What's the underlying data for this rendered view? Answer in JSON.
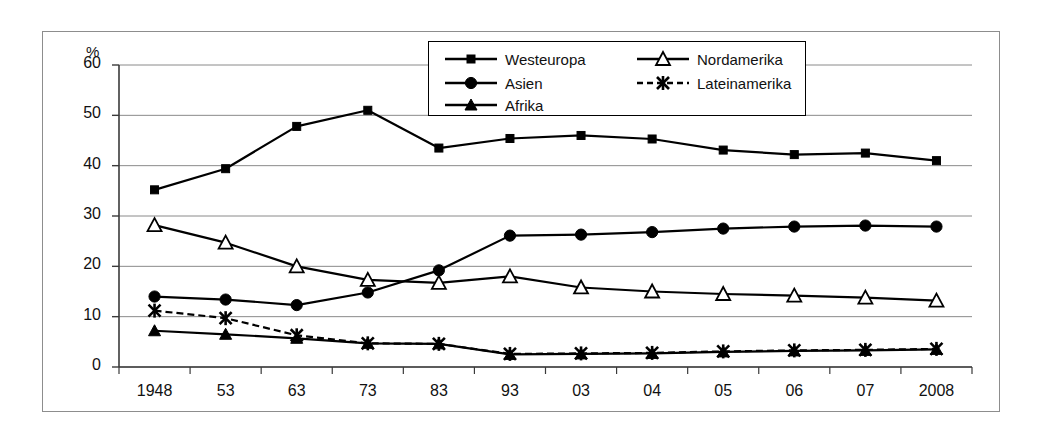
{
  "chart_data": {
    "type": "line",
    "title": "",
    "xlabel": "",
    "ylabel": "%",
    "ylim": [
      0,
      60
    ],
    "ytick_step": 10,
    "grid": true,
    "legend_position": "top-center",
    "categories": [
      "1948",
      "53",
      "63",
      "73",
      "83",
      "93",
      "03",
      "04",
      "05",
      "06",
      "07",
      "2008"
    ],
    "yticks": [
      "0",
      "10",
      "20",
      "30",
      "40",
      "50",
      "60"
    ],
    "series": [
      {
        "name": "Westeuropa",
        "marker": "filled-square",
        "line": "solid",
        "color": "#000000",
        "values": [
          35.2,
          39.4,
          47.8,
          51.0,
          43.5,
          45.4,
          46.0,
          45.3,
          43.1,
          42.2,
          42.5,
          41.0
        ]
      },
      {
        "name": "Asien",
        "marker": "filled-circle",
        "line": "solid",
        "color": "#000000",
        "values": [
          14.0,
          13.4,
          12.3,
          14.8,
          19.2,
          26.1,
          26.3,
          26.8,
          27.5,
          27.9,
          28.1,
          27.9
        ]
      },
      {
        "name": "Afrika",
        "marker": "filled-triangle",
        "line": "solid",
        "color": "#000000",
        "values": [
          7.2,
          6.5,
          5.7,
          4.7,
          4.6,
          2.5,
          2.6,
          2.7,
          3.0,
          3.2,
          3.3,
          3.5
        ]
      },
      {
        "name": "Nordamerika",
        "marker": "open-triangle",
        "line": "solid",
        "color": "#000000",
        "values": [
          28.2,
          24.7,
          20.0,
          17.3,
          16.7,
          18.0,
          15.8,
          15.0,
          14.5,
          14.2,
          13.8,
          13.2
        ]
      },
      {
        "name": "Lateinamerika",
        "marker": "x-cross",
        "line": "dashed",
        "color": "#000000",
        "values": [
          11.2,
          9.7,
          6.3,
          4.7,
          4.6,
          2.6,
          2.7,
          2.8,
          3.1,
          3.3,
          3.4,
          3.6
        ]
      }
    ]
  },
  "legend": {
    "entries": [
      {
        "label": "Westeuropa"
      },
      {
        "label": "Nordamerika"
      },
      {
        "label": "Asien"
      },
      {
        "label": "Lateinamerika"
      },
      {
        "label": "Afrika"
      }
    ]
  }
}
